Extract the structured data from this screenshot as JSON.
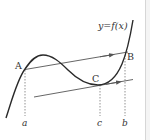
{
  "diagram": {
    "curve_label": "y=f(x)",
    "points": {
      "A": {
        "label": "A"
      },
      "B": {
        "label": "B"
      },
      "C": {
        "label": "C"
      }
    },
    "axis_labels": {
      "a": "a",
      "c": "c",
      "b": "b"
    },
    "colors": {
      "curve": "#2a2a2a",
      "lines": "#555555",
      "dashed": "#777777",
      "text": "#333333",
      "edge": "#d6d6d6"
    }
  }
}
